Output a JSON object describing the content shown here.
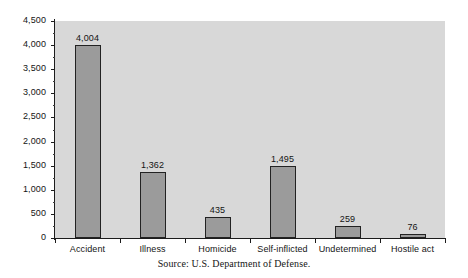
{
  "chart_data": {
    "type": "bar",
    "title": "",
    "subtitle": "",
    "xlabel": "",
    "ylabel": "",
    "categories": [
      "Accident",
      "Illness",
      "Homicide",
      "Self-inflicted",
      "Undetermined",
      "Hostile act"
    ],
    "values": [
      4004,
      1362,
      435,
      1495,
      259,
      76
    ],
    "value_labels": [
      "4,004",
      "1,362",
      "435",
      "1,495",
      "259",
      "76"
    ],
    "ylim": [
      0,
      4500
    ],
    "y_ticks": [
      0,
      500,
      1000,
      1500,
      2000,
      2500,
      3000,
      3500,
      4000,
      4500
    ],
    "y_tick_labels": [
      "0",
      "500",
      "1,000",
      "1,500",
      "2,000",
      "2,500",
      "3,000",
      "3,500",
      "4,000",
      "4,500"
    ],
    "y_minor_tick_interval": 250,
    "grid": false,
    "legend": null,
    "legend_position": "none",
    "bar_color": "#9b9b9b",
    "bar_border_color": "#222222",
    "plot_background": "#d8d8d8",
    "figure_background": "#ffffff",
    "axis_color": "#1c1c1c",
    "text_color": "#141414"
  },
  "source": {
    "note": "Source: U.S. Department of Defense."
  }
}
